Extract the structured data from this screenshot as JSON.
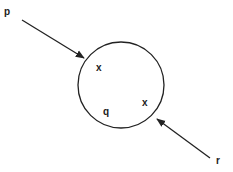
{
  "diagram": {
    "circle": {
      "cx": 121,
      "cy": 85,
      "r": 43,
      "stroke": "#222222"
    },
    "labels": [
      {
        "id": "p",
        "text": "p",
        "x": 4,
        "y": 15
      },
      {
        "id": "x1",
        "text": "x",
        "x": 96,
        "y": 71
      },
      {
        "id": "q",
        "text": "q",
        "x": 103,
        "y": 115
      },
      {
        "id": "x2",
        "text": "x",
        "x": 142,
        "y": 106
      },
      {
        "id": "r",
        "text": "r",
        "x": 216,
        "y": 164
      }
    ],
    "arrows": [
      {
        "id": "arrow-p",
        "from": [
          22,
          20
        ],
        "to": [
          84,
          58
        ]
      },
      {
        "id": "arrow-r",
        "from": [
          210,
          158
        ],
        "to": [
          157,
          119
        ]
      }
    ]
  }
}
